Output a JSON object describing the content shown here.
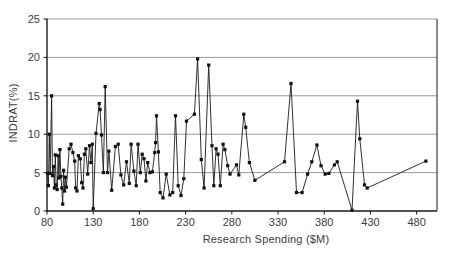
{
  "chart_data": {
    "type": "line",
    "title": "",
    "xlabel": "Research Spending ($M)",
    "ylabel": "INDRAT(%)",
    "xlim": [
      80,
      502
    ],
    "ylim": [
      0,
      25
    ],
    "xticks": [
      80,
      130,
      180,
      230,
      280,
      330,
      380,
      430,
      480
    ],
    "yticks": [
      0,
      5,
      10,
      15,
      20,
      25
    ],
    "grid": "horizontal",
    "legend": "none",
    "marker": "square",
    "marker_color": "#111111",
    "line_color": "#1a1a1a",
    "gridline_color": "#9a9a9a",
    "axis_color": "#1a1a1a",
    "tick_label_color": "#3c3c3c",
    "points": [
      [
        80.5,
        4.9
      ],
      [
        81.5,
        3.3
      ],
      [
        82.5,
        10.0
      ],
      [
        83.5,
        4.9
      ],
      [
        85,
        15.0
      ],
      [
        86,
        4.6
      ],
      [
        87,
        5.8
      ],
      [
        88,
        3.0
      ],
      [
        89,
        7.3
      ],
      [
        90,
        3.4
      ],
      [
        91,
        2.8
      ],
      [
        92,
        7.2
      ],
      [
        93,
        4.3
      ],
      [
        94,
        8.0
      ],
      [
        95,
        4.5
      ],
      [
        96,
        3.0
      ],
      [
        97,
        0.9
      ],
      [
        98,
        5.3
      ],
      [
        99,
        2.6
      ],
      [
        100,
        4.4
      ],
      [
        101,
        3.1
      ],
      [
        104,
        8.1
      ],
      [
        106,
        8.7
      ],
      [
        108,
        7.6
      ],
      [
        110,
        6.5
      ],
      [
        111,
        3.0
      ],
      [
        112.5,
        2.6
      ],
      [
        114,
        7.2
      ],
      [
        116,
        6.8
      ],
      [
        117.5,
        3.7
      ],
      [
        119,
        3.0
      ],
      [
        120.5,
        7.4
      ],
      [
        122,
        8.1
      ],
      [
        124,
        4.8
      ],
      [
        126,
        8.5
      ],
      [
        127.5,
        6.3
      ],
      [
        129,
        8.7
      ],
      [
        130,
        0.3
      ],
      [
        133,
        10.1
      ],
      [
        136.5,
        14.0
      ],
      [
        137.5,
        13.2
      ],
      [
        139,
        9.9
      ],
      [
        141,
        5.0
      ],
      [
        143,
        16.2
      ],
      [
        145.5,
        5.0
      ],
      [
        147,
        7.8
      ],
      [
        150,
        2.7
      ],
      [
        154,
        8.4
      ],
      [
        157,
        8.7
      ],
      [
        160,
        4.7
      ],
      [
        163,
        3.4
      ],
      [
        166,
        6.4
      ],
      [
        169,
        3.6
      ],
      [
        171,
        8.7
      ],
      [
        174,
        5.2
      ],
      [
        176.5,
        3.3
      ],
      [
        178.5,
        8.7
      ],
      [
        181,
        5.0
      ],
      [
        183,
        7.4
      ],
      [
        185,
        6.8
      ],
      [
        187,
        3.9
      ],
      [
        189,
        6.3
      ],
      [
        191.5,
        5.0
      ],
      [
        194,
        5.1
      ],
      [
        196.5,
        7.6
      ],
      [
        197.5,
        8.9
      ],
      [
        198.5,
        12.4
      ],
      [
        200.5,
        7.7
      ],
      [
        202.5,
        2.4
      ],
      [
        205.5,
        1.7
      ],
      [
        209,
        4.8
      ],
      [
        213,
        2.1
      ],
      [
        216,
        2.4
      ],
      [
        219,
        12.4
      ],
      [
        222,
        3.3
      ],
      [
        225,
        2.0
      ],
      [
        228,
        4.2
      ],
      [
        231,
        11.7
      ],
      [
        239.5,
        12.6
      ],
      [
        243,
        19.8
      ],
      [
        247,
        6.7
      ],
      [
        250,
        3.0
      ],
      [
        255,
        19.0
      ],
      [
        258.5,
        8.5
      ],
      [
        260.5,
        3.3
      ],
      [
        263,
        8.1
      ],
      [
        265,
        7.4
      ],
      [
        267.5,
        3.3
      ],
      [
        270.5,
        8.7
      ],
      [
        272.5,
        8.0
      ],
      [
        275.5,
        5.9
      ],
      [
        278,
        4.8
      ],
      [
        285,
        6.0
      ],
      [
        287.5,
        4.7
      ],
      [
        293,
        12.6
      ],
      [
        295,
        10.9
      ],
      [
        299,
        6.3
      ],
      [
        305,
        4.0
      ],
      [
        337,
        6.4
      ],
      [
        344,
        16.6
      ],
      [
        350,
        2.4
      ],
      [
        356,
        2.4
      ],
      [
        362,
        4.8
      ],
      [
        366.5,
        6.4
      ],
      [
        372,
        8.6
      ],
      [
        376.5,
        5.9
      ],
      [
        381,
        4.8
      ],
      [
        385,
        4.9
      ],
      [
        391,
        6.0
      ],
      [
        394,
        6.4
      ],
      [
        410,
        0.1
      ],
      [
        416,
        14.3
      ],
      [
        418.5,
        9.4
      ],
      [
        423.5,
        3.4
      ],
      [
        426.5,
        3.0
      ],
      [
        490,
        6.5
      ]
    ]
  }
}
